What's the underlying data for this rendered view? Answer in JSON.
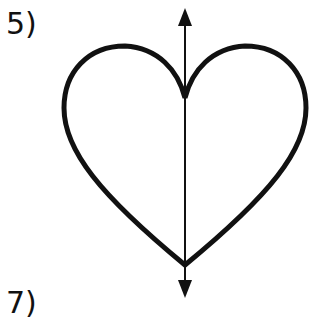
{
  "labels": {
    "top": "5)",
    "bottom": "7)"
  },
  "figure": {
    "shape": "heart",
    "axis": "vertical line of symmetry with arrows at both ends",
    "stroke_color": "#111111",
    "background": "#ffffff"
  }
}
